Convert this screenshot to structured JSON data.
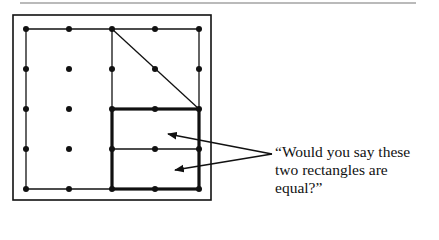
{
  "figure": {
    "top_rule": {
      "x1": 20,
      "x2": 416,
      "y": 3
    },
    "frame": {
      "x": 13,
      "y": 15,
      "width": 198,
      "height": 185
    },
    "geoboard": {
      "columns_x": [
        26,
        69,
        112,
        155,
        199
      ],
      "rows_y": [
        29,
        69,
        109,
        149,
        189
      ],
      "dot_radius": 3
    },
    "thin_segments": [
      [
        26,
        29,
        199,
        29
      ],
      [
        26,
        29,
        26,
        189
      ],
      [
        26,
        189,
        112,
        189
      ],
      [
        112,
        29,
        112,
        109
      ],
      [
        199,
        29,
        199,
        109
      ],
      [
        112,
        29,
        199,
        109
      ],
      [
        112,
        149,
        199,
        149
      ]
    ],
    "thick_square": {
      "x": 112,
      "y": 109,
      "width": 87,
      "height": 80
    },
    "arrows": [
      {
        "from": [
          272,
          154
        ],
        "to": [
          168,
          134
        ]
      },
      {
        "from": [
          272,
          154
        ],
        "to": [
          175,
          170
        ]
      }
    ],
    "color": "#111111"
  },
  "caption": {
    "text": "“Would you say these two rectangles are equal?”"
  }
}
